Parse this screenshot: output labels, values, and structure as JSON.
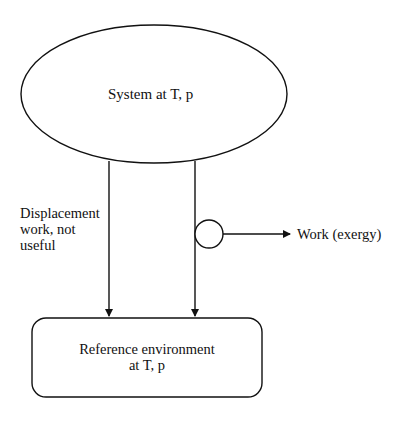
{
  "diagram": {
    "system": {
      "label": "System at T, p",
      "shape": "ellipse"
    },
    "displacement": {
      "line1": "Displacement",
      "line2": "work, not",
      "line3": "useful"
    },
    "work_output": {
      "label": "Work (exergy)",
      "device": "circle"
    },
    "environment": {
      "line1": "Reference environment",
      "line2": "at T, p",
      "shape": "rounded-rectangle"
    },
    "colors": {
      "stroke": "#111111",
      "background": "#ffffff"
    }
  }
}
